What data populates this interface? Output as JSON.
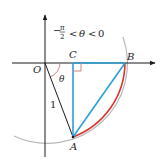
{
  "diagram": {
    "condition": {
      "minus": "−",
      "pi": "π",
      "two": "2",
      "rel1": "<",
      "theta": "θ",
      "rel2": "<",
      "zero": "0"
    },
    "labels": {
      "O": "O",
      "C": "C",
      "B": "B",
      "A": "A",
      "theta": "θ",
      "radius": "1"
    },
    "colors": {
      "axis": "#1a1a1a",
      "circle": "#b0b0b0",
      "arc_AB": "#d8342c",
      "triangle": "#2aa0d8",
      "angle_mark": "#d08080",
      "radius_line": "#1a1a1a"
    }
  }
}
